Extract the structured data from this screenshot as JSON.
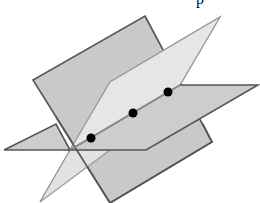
{
  "figure": {
    "top_text_fragment": "p",
    "colors": {
      "background": "#ffffff",
      "plane_dark_fill": "#c9c9c9",
      "plane_dark_stroke": "#555555",
      "plane_light_fill": "#e4e4e4",
      "plane_light_stroke": "#9a9a9a",
      "plane_horizontal_fill": "#cfcfcf",
      "plane_horizontal_stroke": "#555555",
      "point_color": "#000000",
      "line_color": "#9a9a9a"
    },
    "planes": [
      {
        "name": "tilted-dark-plane",
        "points": "145,16 212,142 110,203 33,80"
      },
      {
        "name": "light-plane",
        "points": "220,17 180,85 70,150 40,202 110,82 145,62"
      },
      {
        "name": "horizontal-plane",
        "points": "4,150 70,118 180,85 258,85 146,150"
      }
    ],
    "intersection_line": {
      "x1": 70,
      "y1": 150,
      "x2": 180,
      "y2": 85
    },
    "points": [
      {
        "label": "",
        "x": 91,
        "y": 138
      },
      {
        "label": "",
        "x": 133,
        "y": 113
      },
      {
        "label": "",
        "x": 168,
        "y": 92
      }
    ]
  }
}
